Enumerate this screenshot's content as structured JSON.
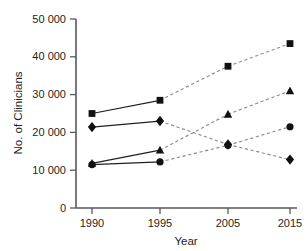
{
  "chart_data": {
    "type": "line",
    "title": "",
    "xlabel": "Year",
    "ylabel": "No. of Clinicians",
    "categories": [
      "1990",
      "1995",
      "2005",
      "2015"
    ],
    "x_tick_labels": [
      "1990",
      "1995",
      "2005",
      "2015"
    ],
    "y_tick_labels": [
      "0",
      "10 000",
      "20 000",
      "30 000",
      "40 000",
      "50 000"
    ],
    "y_tick_values": [
      0,
      10000,
      20000,
      30000,
      40000,
      50000
    ],
    "ylim": [
      0,
      50000
    ],
    "grid": false,
    "legend": "none",
    "series": [
      {
        "name": "square-series",
        "marker": "square",
        "values": [
          25000,
          28500,
          37500,
          43500
        ],
        "solid_segment_end_index": 1
      },
      {
        "name": "diamond-series",
        "marker": "diamond",
        "values": [
          21400,
          23000,
          16800,
          12800
        ],
        "solid_segment_end_index": 1
      },
      {
        "name": "triangle-series",
        "marker": "triangle",
        "values": [
          11800,
          15300,
          24800,
          31000
        ],
        "solid_segment_end_index": 1
      },
      {
        "name": "circle-series",
        "marker": "circle",
        "values": [
          11500,
          12200,
          16600,
          21500
        ],
        "solid_segment_end_index": 1
      }
    ],
    "line_style_note": {
      "observed": "solid",
      "projected": "dashed"
    },
    "colors": {
      "marker": "#111111",
      "solid_line": "#231f20",
      "dashed_line": "#8c8c8c",
      "axis": "#58595b",
      "text": "#231f20",
      "background": "#ffffff"
    }
  }
}
